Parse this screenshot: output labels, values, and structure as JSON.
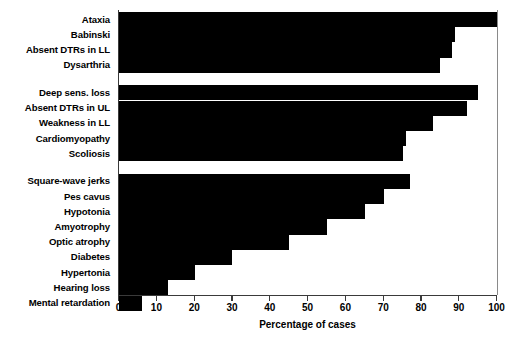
{
  "chart_data": {
    "type": "bar",
    "orientation": "horizontal",
    "title": "",
    "xlabel": "Percentage of cases",
    "ylabel": "",
    "xlim": [
      0,
      100
    ],
    "ylim": null,
    "grid": false,
    "legend": null,
    "bar_color": "#000000",
    "axis_color": "#3a3a3a",
    "xticks": [
      0,
      10,
      20,
      30,
      40,
      50,
      60,
      70,
      80,
      90,
      100
    ],
    "xtick_labels": [
      "0",
      "10",
      "20",
      "30",
      "40",
      "50",
      "60",
      "70",
      "80",
      "90",
      "100"
    ],
    "groups": [
      {
        "name": "group-1",
        "categories": [
          "Ataxia",
          "Babinski",
          "Absent DTRs in LL",
          "Dysarthria"
        ],
        "values": [
          100,
          89,
          88,
          85
        ]
      },
      {
        "name": "group-2",
        "categories": [
          "Deep sens. loss",
          "Absent DTRs in UL",
          "Weakness in LL",
          "Cardiomyopathy",
          "Scoliosis"
        ],
        "values": [
          95,
          92,
          83,
          76,
          75
        ]
      },
      {
        "name": "group-3",
        "categories": [
          "Square-wave jerks",
          "Pes cavus",
          "Hypotonia",
          "Amyotrophy",
          "Optic atrophy",
          "Diabetes",
          "Hypertonia",
          "Hearing loss",
          "Mental retardation"
        ],
        "values": [
          77,
          70,
          65,
          55,
          45,
          30,
          20,
          13,
          6
        ]
      }
    ],
    "categories": [
      "Ataxia",
      "Babinski",
      "Absent DTRs in LL",
      "Dysarthria",
      "Deep sens. loss",
      "Absent DTRs in UL",
      "Weakness in LL",
      "Cardiomyopathy",
      "Scoliosis",
      "Square-wave jerks",
      "Pes cavus",
      "Hypotonia",
      "Amyotrophy",
      "Optic atrophy",
      "Diabetes",
      "Hypertonia",
      "Hearing loss",
      "Mental retardation"
    ],
    "values": [
      100,
      89,
      88,
      85,
      95,
      92,
      83,
      76,
      75,
      77,
      70,
      65,
      55,
      45,
      30,
      20,
      13,
      6
    ]
  },
  "axis": {
    "x_title": "Percentage of cases"
  }
}
